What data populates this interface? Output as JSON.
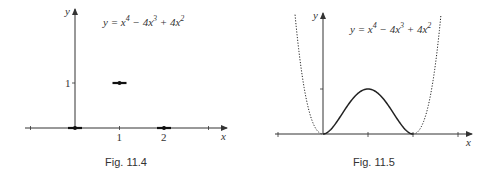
{
  "chart_data": [
    {
      "type": "scatter",
      "title": "",
      "caption": "Fig. 11.4",
      "equation": {
        "lhs": "y",
        "terms": [
          "x",
          "4",
          " − 4x",
          "3",
          " + 4x",
          "2"
        ]
      },
      "xlabel": "x",
      "ylabel": "y",
      "xlim": [
        -1,
        3.4
      ],
      "ylim": [
        0,
        1.8
      ],
      "x_ticks": [
        -1,
        1,
        2,
        3
      ],
      "x_tick_labels": [
        "",
        "1",
        "2",
        ""
      ],
      "y_ticks": [
        1
      ],
      "y_tick_labels": [
        "1"
      ],
      "points": [
        {
          "x": 0,
          "y": 0
        },
        {
          "x": 1,
          "y": 1
        },
        {
          "x": 2,
          "y": 0
        }
      ],
      "grid": false
    },
    {
      "type": "line",
      "title": "",
      "caption": "Fig. 11.5",
      "equation": {
        "lhs": "y",
        "terms": [
          "x",
          "4",
          " − 4x",
          "3",
          " + 4x",
          "2"
        ]
      },
      "xlabel": "x",
      "ylabel": "y",
      "xlim": [
        -1,
        3.4
      ],
      "ylim": [
        0,
        3
      ],
      "x_ticks": [
        -1,
        1,
        2,
        3
      ],
      "y_ticks": [
        1
      ],
      "series": [
        {
          "name": "solid segment",
          "style": "solid",
          "x_range": [
            0,
            2
          ],
          "function": "x^4 - 4x^3 + 4x^2"
        },
        {
          "name": "dotted left",
          "style": "dotted",
          "x_range": [
            -0.7,
            0
          ],
          "function": "x^4 - 4x^3 + 4x^2"
        },
        {
          "name": "dotted right",
          "style": "dotted",
          "x_range": [
            2,
            2.7
          ],
          "function": "x^4 - 4x^3 + 4x^2"
        }
      ],
      "grid": false
    }
  ]
}
